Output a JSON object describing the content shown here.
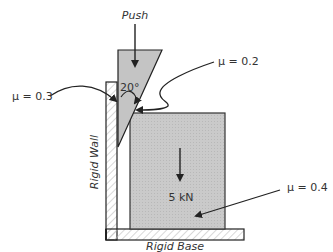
{
  "diagram": {
    "push_label": "Push",
    "angle_label": "20°",
    "wall_label": "Rigid Wall",
    "base_label": "Rigid Base",
    "load_label": "5 kN",
    "friction": {
      "wall_wedge": "μ = 0.3",
      "wedge_block": "μ = 0.2",
      "block_base": "μ = 0.4"
    },
    "colors": {
      "fill_gray": "#c8c8c8",
      "stroke": "#222222",
      "hatch": "#bdbdbd"
    }
  }
}
